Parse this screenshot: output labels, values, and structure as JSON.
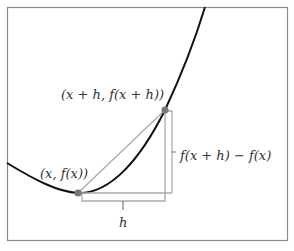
{
  "diagram": {
    "labels": {
      "point1": "(x, f(x))",
      "point2": "(x + h, f(x + h))",
      "rise": "f(x + h) − f(x)",
      "run": "h"
    },
    "colors": {
      "curve": "#111111",
      "secant": "#aaaaaa",
      "point": "#777777",
      "frame": "#888888"
    }
  }
}
